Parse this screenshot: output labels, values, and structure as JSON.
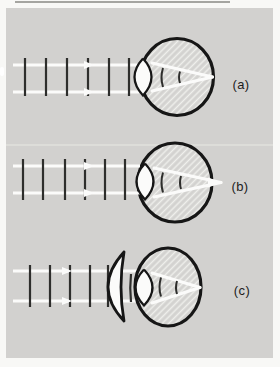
{
  "page": {
    "background": "#f8f8f6",
    "panel_background": "#d2d1cf",
    "ink_color": "#161616",
    "ray_color": "#fbfbfa",
    "hatch_line_color": "#efefec",
    "label_color": "#1c1c1c"
  },
  "figures": [
    {
      "label": "(a)",
      "name": "parallel-wavefronts-focused-on-retina"
    },
    {
      "label": "(b)",
      "name": "wavefronts-focused-behind-retina"
    },
    {
      "label": "(c)",
      "name": "corrective-converging-lens-focuses-on-retina"
    }
  ]
}
